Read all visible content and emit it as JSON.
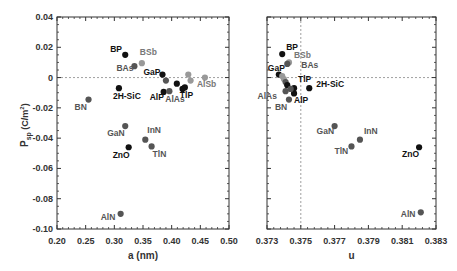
{
  "chart_data": [
    {
      "type": "scatter",
      "panel": "left",
      "title": "",
      "xlabel": "a  (nm)",
      "ylabel": "P_sp (C/m^2)",
      "ylabel_main": "P",
      "ylabel_sub": "sp",
      "ylabel_unit": "(C/m",
      "ylabel_sup": "2",
      "ylabel_close": ")",
      "xlim": [
        0.2,
        0.5
      ],
      "ylim": [
        -0.1,
        0.04
      ],
      "xticks": [
        "0.20",
        "0.25",
        "0.30",
        "0.35",
        "0.40",
        "0.45",
        "0.50"
      ],
      "yticks": [
        "0.04",
        "0.02",
        "0",
        "-0.02",
        "-0.04",
        "-0.06",
        "-0.08",
        "-0.10"
      ],
      "reference_lines": [
        {
          "orientation": "horizontal",
          "value": 0,
          "style": "dashed"
        }
      ],
      "points": [
        {
          "name": "BP",
          "x": 0.319,
          "y": 0.015,
          "shade": "dark",
          "label_dx": -15,
          "label_dy": -3
        },
        {
          "name": "BSb",
          "x": 0.348,
          "y": 0.0095,
          "shade": "light",
          "label_dx": -2,
          "label_dy": -8
        },
        {
          "name": "BAs",
          "x": 0.335,
          "y": 0.0075,
          "shade": "mid",
          "label_dx": -18,
          "label_dy": 5
        },
        {
          "name": "GaP",
          "x": 0.384,
          "y": 0.002,
          "shade": "dark",
          "label_dx": -19,
          "label_dy": 0
        },
        {
          "name": "2H-SiC",
          "x": 0.308,
          "y": -0.007,
          "shade": "dark",
          "label_dx": -6,
          "label_dy": 11
        },
        {
          "name": "BN",
          "x": 0.255,
          "y": -0.0145,
          "shade": "mid",
          "label_dx": -14,
          "label_dy": 10
        },
        {
          "name": "AlP",
          "x": 0.386,
          "y": -0.0095,
          "shade": "dark",
          "label_dx": -14,
          "label_dy": 8
        },
        {
          "name": "AlAs",
          "x": 0.396,
          "y": -0.009,
          "shade": "mid",
          "label_dx": -4,
          "label_dy": 11
        },
        {
          "name": "TlP",
          "x": 0.423,
          "y": -0.0065,
          "shade": "dark",
          "label_dx": -5,
          "label_dy": 11
        },
        {
          "name": "AlSb",
          "x": 0.458,
          "y": 0.0,
          "shade": "light",
          "label_dx": -8,
          "label_dy": 9
        },
        {
          "name": "",
          "x": 0.39,
          "y": -0.002,
          "shade": "mid"
        },
        {
          "name": "",
          "x": 0.409,
          "y": -0.004,
          "shade": "dark"
        },
        {
          "name": "",
          "x": 0.419,
          "y": -0.0075,
          "shade": "dark"
        },
        {
          "name": "",
          "x": 0.429,
          "y": 0.002,
          "shade": "light"
        },
        {
          "name": "",
          "x": 0.433,
          "y": -0.002,
          "shade": "light"
        },
        {
          "name": "GaN",
          "x": 0.319,
          "y": -0.032,
          "shade": "mid",
          "label_dx": -18,
          "label_dy": 10
        },
        {
          "name": "InN",
          "x": 0.354,
          "y": -0.041,
          "shade": "mid",
          "label_dx": 2,
          "label_dy": -7
        },
        {
          "name": "ZnO",
          "x": 0.325,
          "y": -0.046,
          "shade": "dark",
          "label_dx": -16,
          "label_dy": 11
        },
        {
          "name": "TlN",
          "x": 0.365,
          "y": -0.0455,
          "shade": "mid",
          "label_dx": 1,
          "label_dy": 11
        },
        {
          "name": "AlN",
          "x": 0.311,
          "y": -0.09,
          "shade": "mid",
          "label_dx": -20,
          "label_dy": 6
        }
      ]
    },
    {
      "type": "scatter",
      "panel": "right",
      "title": "",
      "xlabel": "u",
      "ylabel": "P_sp (C/m^2)",
      "xlim": [
        0.373,
        0.383
      ],
      "ylim": [
        -0.1,
        0.04
      ],
      "xticks": [
        "0.373",
        "0.375",
        "0.377",
        "0.379",
        "0.381",
        "0.383"
      ],
      "yticks": [],
      "reference_lines": [
        {
          "orientation": "horizontal",
          "value": 0,
          "style": "dashed"
        },
        {
          "orientation": "vertical",
          "value": 0.375,
          "style": "dashed"
        }
      ],
      "points": [
        {
          "name": "BP",
          "x": 0.3739,
          "y": 0.0155,
          "shade": "dark",
          "label_dx": 4,
          "label_dy": -4
        },
        {
          "name": "BSb",
          "x": 0.3743,
          "y": 0.01,
          "shade": "light",
          "label_dx": 5,
          "label_dy": -4
        },
        {
          "name": "BAs",
          "x": 0.3742,
          "y": 0.009,
          "shade": "mid",
          "label_dx": 14,
          "label_dy": 4
        },
        {
          "name": "GaP",
          "x": 0.3737,
          "y": 0.002,
          "shade": "dark",
          "label_dx": -11,
          "label_dy": -4
        },
        {
          "name": "TlP",
          "x": 0.3746,
          "y": -0.007,
          "shade": "dark",
          "label_dx": 4,
          "label_dy": -6
        },
        {
          "name": "2H-SiC",
          "x": 0.3755,
          "y": -0.007,
          "shade": "dark",
          "label_dx": 7,
          "label_dy": -1
        },
        {
          "name": "AlAs",
          "x": 0.3741,
          "y": -0.009,
          "shade": "mid",
          "label_dx": -28,
          "label_dy": 8
        },
        {
          "name": "AlP",
          "x": 0.3746,
          "y": -0.0105,
          "shade": "dark",
          "label_dx": 0,
          "label_dy": 10
        },
        {
          "name": "BN",
          "x": 0.3743,
          "y": -0.0145,
          "shade": "mid",
          "label_dx": -14,
          "label_dy": 10
        },
        {
          "name": "",
          "x": 0.3739,
          "y": 0.001,
          "shade": "light"
        },
        {
          "name": "",
          "x": 0.374,
          "y": -0.001,
          "shade": "light"
        },
        {
          "name": "",
          "x": 0.3741,
          "y": -0.003,
          "shade": "mid"
        },
        {
          "name": "",
          "x": 0.3742,
          "y": -0.005,
          "shade": "dark"
        },
        {
          "name": "",
          "x": 0.3744,
          "y": -0.0075,
          "shade": "mid"
        },
        {
          "name": "GaN",
          "x": 0.377,
          "y": -0.032,
          "shade": "mid",
          "label_dx": -18,
          "label_dy": 8
        },
        {
          "name": "InN",
          "x": 0.3785,
          "y": -0.041,
          "shade": "mid",
          "label_dx": 4,
          "label_dy": -6
        },
        {
          "name": "TlN",
          "x": 0.378,
          "y": -0.0455,
          "shade": "mid",
          "label_dx": -17,
          "label_dy": 8
        },
        {
          "name": "ZnO",
          "x": 0.382,
          "y": -0.046,
          "shade": "dark",
          "label_dx": -17,
          "label_dy": 10
        },
        {
          "name": "AlN",
          "x": 0.3821,
          "y": -0.089,
          "shade": "mid",
          "label_dx": -20,
          "label_dy": 5
        }
      ]
    }
  ],
  "colors": {
    "dark": "#111111",
    "mid": "#555555",
    "light": "#999999",
    "label_dark": "#111111",
    "label_mid": "#555555",
    "label_light": "#777777",
    "frame": "#333333",
    "refline": "#888888"
  }
}
